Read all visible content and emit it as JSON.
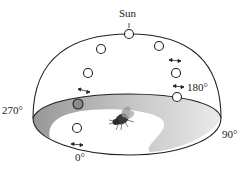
{
  "figure": {
    "labels": {
      "sun": "Sun",
      "deg_180": "180°",
      "deg_270": "270°",
      "deg_90": "90°",
      "deg_0": "0°"
    },
    "colors": {
      "outline": "#222222",
      "floor_shade": "#9a9a9a",
      "highlighted_circle": "#8a8a8a"
    },
    "sun_positions_count": 8,
    "highlighted_position": "270° side, near horizon"
  }
}
